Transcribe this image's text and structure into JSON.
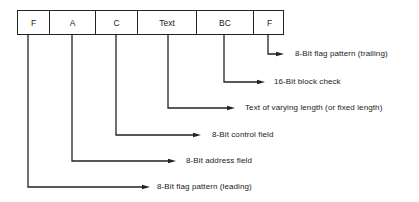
{
  "diagram": {
    "type": "frame-format",
    "fields": [
      {
        "label": "F",
        "x": 0,
        "w": 32,
        "line_x": 28,
        "arrow_y": 187,
        "arrow_end": 150,
        "desc": "8-Bit flag pattern (leading)",
        "desc_x": 157
      },
      {
        "label": "A",
        "x": 32,
        "w": 46,
        "line_x": 72,
        "arrow_y": 161,
        "arrow_end": 176,
        "desc": "8-Bit address field",
        "desc_x": 186
      },
      {
        "label": "C",
        "x": 78,
        "w": 42,
        "line_x": 116,
        "arrow_y": 135,
        "arrow_end": 201,
        "desc": "8-Bit control field",
        "desc_x": 212
      },
      {
        "label": "Text",
        "x": 120,
        "w": 59,
        "line_x": 168,
        "arrow_y": 108,
        "arrow_end": 235,
        "desc": "Text of varying length (or fixed length)",
        "desc_x": 245
      },
      {
        "label": "BC",
        "x": 179,
        "w": 57,
        "line_x": 224,
        "arrow_y": 82,
        "arrow_end": 265,
        "desc": "16-Bit block check",
        "desc_x": 274
      },
      {
        "label": "F",
        "x": 236,
        "w": 31,
        "line_x": 268,
        "arrow_y": 54,
        "arrow_end": 284,
        "desc": "8-Bit flag pattern (trailing)",
        "desc_x": 295
      }
    ],
    "colors": {
      "line": "#222222",
      "text": "#1a1a1a",
      "background": "#ffffff"
    }
  }
}
